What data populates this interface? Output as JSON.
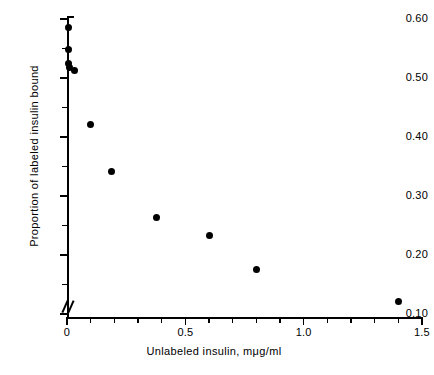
{
  "chart_data": {
    "type": "scatter",
    "title": "",
    "xlabel": "Unlabeled insulin, mμg/ml",
    "ylabel": "Proportion of labeled insulin bound",
    "xlim": [
      0,
      1.5
    ],
    "ylim": [
      0.095,
      0.605
    ],
    "grid": false,
    "legend": null,
    "axis_break": "y-axis broken below 0.10 at origin",
    "x_ticks_major": [
      0,
      0.5,
      1.0,
      1.5
    ],
    "x_ticklabels": [
      "0",
      "0.5",
      "1.0",
      "1.5"
    ],
    "x_ticks_minor": [
      0.1,
      0.2,
      0.3,
      0.4,
      0.6,
      0.7,
      0.8,
      0.9,
      1.1,
      1.2,
      1.3,
      1.4
    ],
    "y_ticks_major": [
      0.1,
      0.2,
      0.3,
      0.4,
      0.5,
      0.6
    ],
    "y_ticklabels": [
      "0.10",
      "0.20",
      "0.30",
      "0.40",
      "0.50",
      "0.60"
    ],
    "y_ticks_minor": [
      0.15,
      0.25,
      0.35,
      0.45,
      0.55
    ],
    "points": [
      {
        "x": 0.005,
        "y": 0.585
      },
      {
        "x": 0.005,
        "y": 0.548
      },
      {
        "x": 0.005,
        "y": 0.524
      },
      {
        "x": 0.01,
        "y": 0.518
      },
      {
        "x": 0.03,
        "y": 0.512
      },
      {
        "x": 0.1,
        "y": 0.421
      },
      {
        "x": 0.19,
        "y": 0.342
      },
      {
        "x": 0.38,
        "y": 0.263
      },
      {
        "x": 0.6,
        "y": 0.233
      },
      {
        "x": 0.8,
        "y": 0.176
      },
      {
        "x": 1.4,
        "y": 0.122
      }
    ]
  }
}
